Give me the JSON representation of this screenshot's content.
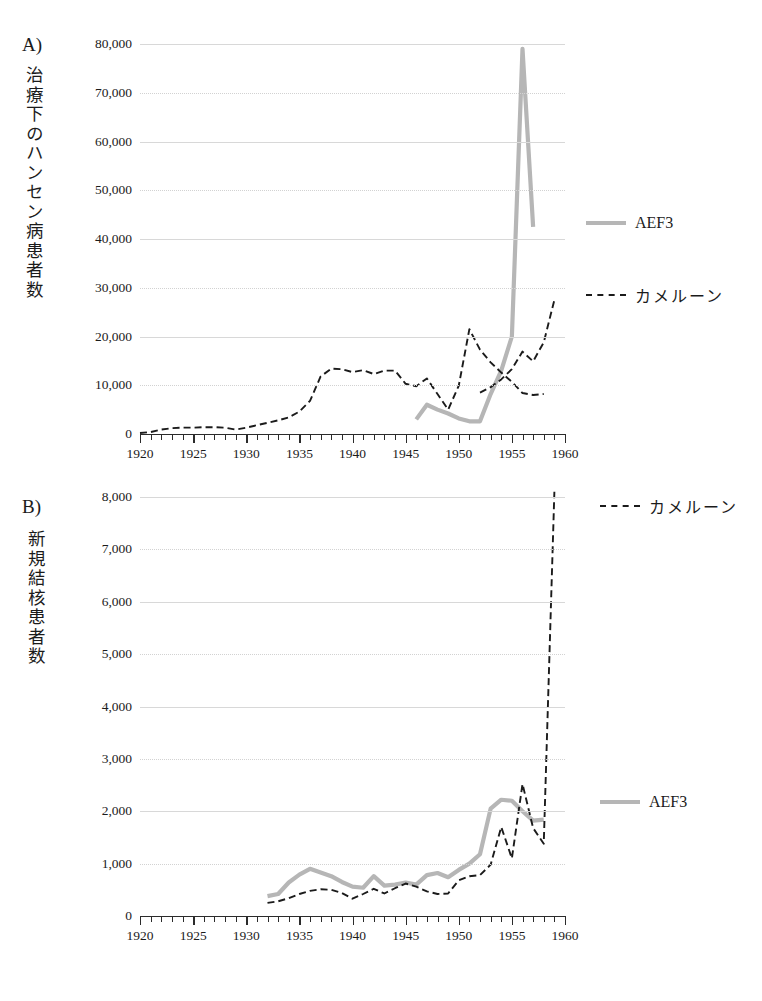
{
  "figure": {
    "panels": [
      {
        "letter": "A)",
        "vertical_axis_title": "治療下のハンセン病患者数",
        "ylabels": [
          "80,000",
          "70,000",
          "60,000",
          "50,000",
          "40,000",
          "30,000",
          "20,000",
          "10,000",
          "0"
        ],
        "xlabels": [
          "1920",
          "1925",
          "1930",
          "1935",
          "1940",
          "1945",
          "1950",
          "1955",
          "1960"
        ],
        "legend": [
          {
            "label": "AEF3",
            "style": "solid",
            "color": "#b6b6b6"
          },
          {
            "label": "カメルーン",
            "style": "dashed",
            "color": "#1b1b1b"
          }
        ]
      },
      {
        "letter": "B)",
        "vertical_axis_title": "新規結核患者数",
        "ylabels": [
          "8,000",
          "7,000",
          "6,000",
          "5,000",
          "4,000",
          "3,000",
          "2,000",
          "1,000",
          "0"
        ],
        "xlabels": [
          "1920",
          "1925",
          "1930",
          "1935",
          "1940",
          "1945",
          "1950",
          "1955",
          "1960"
        ],
        "legend": [
          {
            "label": "カメルーン",
            "style": "dashed",
            "color": "#1b1b1b"
          },
          {
            "label": "AEF3",
            "style": "solid",
            "color": "#b6b6b6"
          }
        ]
      }
    ],
    "caption": ""
  },
  "chart_data": [
    {
      "id": "panel-a",
      "type": "line",
      "title": "A) 治療下のハンセン病患者数",
      "xlabel": "",
      "ylabel": "治療下のハンセン病患者数",
      "xlim": [
        1920,
        1960
      ],
      "ylim": [
        0,
        80000
      ],
      "ytick_step": 10000,
      "xtick_step": 1,
      "xtick_label_step": 5,
      "grid": true,
      "legend_position": "right",
      "series": [
        {
          "name": "AEF3",
          "style": "solid",
          "color": "#b6b6b6",
          "x": [
            1946,
            1947,
            1948,
            1949,
            1950,
            1951,
            1952,
            1953,
            1954,
            1955,
            1956,
            1957
          ],
          "values": [
            3000,
            6000,
            5000,
            4200,
            3200,
            2600,
            2600,
            8200,
            13000,
            20000,
            79000,
            42500
          ]
        },
        {
          "name": "カメルーン",
          "style": "dashed",
          "color": "#1b1b1b",
          "x": [
            1920,
            1921,
            1922,
            1923,
            1924,
            1925,
            1926,
            1927,
            1928,
            1929,
            1930,
            1931,
            1932,
            1933,
            1934,
            1935,
            1936,
            1937,
            1938,
            1939,
            1940,
            1941,
            1942,
            1943,
            1944,
            1945,
            1946,
            1947,
            1948,
            1949,
            1950,
            1951,
            1952,
            1953,
            1954,
            1955,
            1956,
            1957,
            1958
          ],
          "values": [
            200,
            400,
            900,
            1200,
            1300,
            1300,
            1400,
            1400,
            1300,
            900,
            1300,
            1800,
            2300,
            2800,
            3400,
            4600,
            6800,
            11800,
            13400,
            13300,
            12700,
            13100,
            12300,
            13000,
            13000,
            10300,
            9800,
            11400,
            8200,
            5000,
            9900,
            21500,
            17300,
            14700,
            12600,
            10700,
            8400,
            8000,
            8200
          ]
        }
      ],
      "series_secondary_note": {
        "name": "カメルーン",
        "note": "continues after 1952 rising",
        "x": [
          1952,
          1953,
          1954,
          1955,
          1956,
          1957,
          1958,
          1959
        ],
        "values": [
          8500,
          9600,
          11200,
          13300,
          16900,
          14900,
          18800,
          27500
        ]
      }
    },
    {
      "id": "panel-b",
      "type": "line",
      "title": "B) 新規結核患者数",
      "xlabel": "",
      "ylabel": "新規結核患者数",
      "xlim": [
        1920,
        1960
      ],
      "ylim": [
        0,
        8000
      ],
      "ytick_step": 1000,
      "xtick_step": 1,
      "xtick_label_step": 5,
      "grid": true,
      "legend_position": "right",
      "series": [
        {
          "name": "AEF3",
          "style": "solid",
          "color": "#b6b6b6",
          "x": [
            1932,
            1933,
            1934,
            1935,
            1936,
            1937,
            1938,
            1939,
            1940,
            1941,
            1942,
            1943,
            1944,
            1945,
            1946,
            1947,
            1948,
            1949,
            1950,
            1951,
            1952,
            1953,
            1954,
            1955,
            1956,
            1957,
            1958
          ],
          "values": [
            380,
            420,
            640,
            790,
            900,
            830,
            760,
            650,
            560,
            540,
            760,
            580,
            600,
            640,
            600,
            780,
            820,
            740,
            880,
            1000,
            1180,
            2050,
            2220,
            2200,
            2000,
            1820,
            1840
          ]
        },
        {
          "name": "カメルーン",
          "style": "dashed",
          "color": "#1b1b1b",
          "x": [
            1932,
            1933,
            1934,
            1935,
            1936,
            1937,
            1938,
            1939,
            1940,
            1941,
            1942,
            1943,
            1944,
            1945,
            1946,
            1947,
            1948,
            1949,
            1950,
            1951,
            1952,
            1953,
            1954,
            1955,
            1956,
            1957,
            1958,
            1959
          ],
          "values": [
            250,
            280,
            340,
            420,
            480,
            510,
            500,
            440,
            330,
            420,
            520,
            430,
            530,
            620,
            560,
            470,
            420,
            430,
            680,
            760,
            780,
            980,
            1700,
            1100,
            2520,
            1680,
            1380,
            8100
          ]
        }
      ]
    }
  ]
}
